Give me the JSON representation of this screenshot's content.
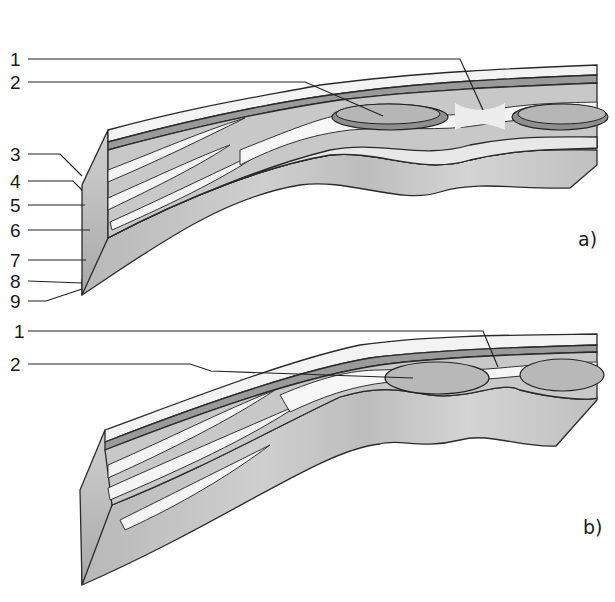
{
  "figure": {
    "panels": [
      {
        "id": "a",
        "label": "a)",
        "callouts": [
          "1",
          "2",
          "3",
          "4",
          "5",
          "6",
          "7",
          "8",
          "9"
        ]
      },
      {
        "id": "b",
        "label": "b)",
        "callouts": [
          "1",
          "2"
        ]
      }
    ]
  },
  "colors": {
    "background": "#ffffff",
    "light_layer": "#f2f2f2",
    "mid_layer": "#bdbdbd",
    "dark_layer": "#8f8f8f",
    "base_tissue": "#c4c4c4",
    "outline": "#2a2a2a"
  }
}
